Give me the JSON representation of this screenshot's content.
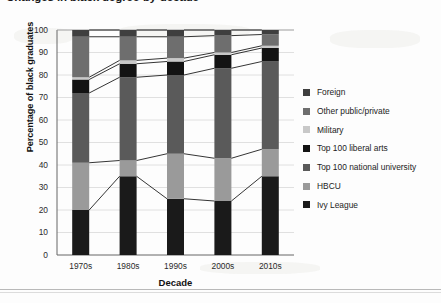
{
  "title": "Changes in black degree-by-decade",
  "axes": {
    "ylabel": "Percentage of black graduates",
    "xlabel": "Decade",
    "yticks": [
      "100",
      "90",
      "80",
      "70",
      "60",
      "50",
      "40",
      "30",
      "20",
      "10",
      "0"
    ],
    "xticks": [
      "1970s",
      "1980s",
      "1990s",
      "2000s",
      "2010s"
    ]
  },
  "legend": {
    "items": [
      {
        "label": "Foreign",
        "color": "#3f3f3f"
      },
      {
        "label": "Other public/private",
        "color": "#6e6e6e"
      },
      {
        "label": "Military",
        "color": "#c8c8c8"
      },
      {
        "label": "Top 100 liberal arts",
        "color": "#131313"
      },
      {
        "label": "Top 100 national university",
        "color": "#5a5a5a"
      },
      {
        "label": "HBCU",
        "color": "#9a9a9a"
      },
      {
        "label": "Ivy League",
        "color": "#1a1a1a"
      }
    ]
  },
  "chart_data": {
    "type": "bar",
    "subtype": "stacked-100-percent-with-connectors",
    "title": "Changes in black degree-by-decade",
    "xlabel": "Decade",
    "ylabel": "Percentage of black graduates",
    "ylim": [
      0,
      100
    ],
    "grid": true,
    "legend_position": "right",
    "categories": [
      "1970s",
      "1980s",
      "1990s",
      "2000s",
      "2010s"
    ],
    "stack_order_bottom_to_top": [
      "Ivy League",
      "HBCU",
      "Top 100 national university",
      "Top 100 liberal arts",
      "Military",
      "Other public/private",
      "Foreign"
    ],
    "series": [
      {
        "name": "Ivy League",
        "color": "#1a1a1a",
        "values": [
          20,
          35,
          25,
          24,
          35
        ]
      },
      {
        "name": "HBCU",
        "color": "#9a9a9a",
        "values": [
          21,
          7,
          20,
          19,
          12
        ]
      },
      {
        "name": "Top 100 national university",
        "color": "#5a5a5a",
        "values": [
          31,
          37,
          35,
          40,
          39
        ]
      },
      {
        "name": "Top 100 liberal arts",
        "color": "#131313",
        "values": [
          6,
          6,
          6,
          6,
          6
        ]
      },
      {
        "name": "Military",
        "color": "#c8c8c8",
        "values": [
          1,
          1.5,
          1.5,
          1,
          1
        ]
      },
      {
        "name": "Other public/private",
        "color": "#6e6e6e",
        "values": [
          18,
          10.5,
          9.5,
          7.5,
          5
        ]
      },
      {
        "name": "Foreign",
        "color": "#3f3f3f",
        "values": [
          3,
          3,
          3,
          2.5,
          2
        ]
      }
    ],
    "cumulative_tops": {
      "1970s": {
        "Ivy League": 20,
        "HBCU": 41,
        "Top 100 national university": 72,
        "Top 100 liberal arts": 78,
        "Military": 79,
        "Other public/private": 97,
        "Foreign": 100
      },
      "1980s": {
        "Ivy League": 35,
        "HBCU": 42,
        "Top 100 national university": 79,
        "Top 100 liberal arts": 85,
        "Military": 86.5,
        "Other public/private": 97,
        "Foreign": 100
      },
      "1990s": {
        "Ivy League": 25,
        "HBCU": 45,
        "Top 100 national university": 80,
        "Top 100 liberal arts": 86,
        "Military": 87.5,
        "Other public/private": 97,
        "Foreign": 100
      },
      "2000s": {
        "Ivy League": 24,
        "HBCU": 43,
        "Top 100 national university": 83,
        "Top 100 liberal arts": 89,
        "Military": 90,
        "Other public/private": 97.5,
        "Foreign": 100
      },
      "2010s": {
        "Ivy League": 35,
        "HBCU": 47,
        "Top 100 national university": 86,
        "Top 100 liberal arts": 92,
        "Military": 93,
        "Other public/private": 98,
        "Foreign": 100
      }
    }
  }
}
